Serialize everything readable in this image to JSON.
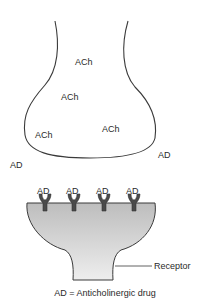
{
  "diagram": {
    "presynaptic_labels": [
      {
        "text": "ACh",
        "x": 75,
        "y": 57
      },
      {
        "text": "ACh",
        "x": 61,
        "y": 92
      },
      {
        "text": "ACh",
        "x": 35,
        "y": 130
      },
      {
        "text": "ACh",
        "x": 102,
        "y": 124
      }
    ],
    "free_drug_labels": [
      {
        "text": "AD",
        "x": 10,
        "y": 160
      },
      {
        "text": "AD",
        "x": 158,
        "y": 150
      }
    ],
    "receptor_drug_labels": [
      {
        "text": "AD",
        "x": 37
      },
      {
        "text": "AD",
        "x": 66
      },
      {
        "text": "AD",
        "x": 96
      },
      {
        "text": "AD",
        "x": 126
      }
    ],
    "receptor_label": "Receptor",
    "caption": "AD = Anticholinergic drug",
    "colors": {
      "outline": "#3a3a3a",
      "postsynaptic_fill_top": "#c4c4c4",
      "postsynaptic_fill_bottom": "#ececec",
      "receptor": "#4a4a4a"
    }
  }
}
